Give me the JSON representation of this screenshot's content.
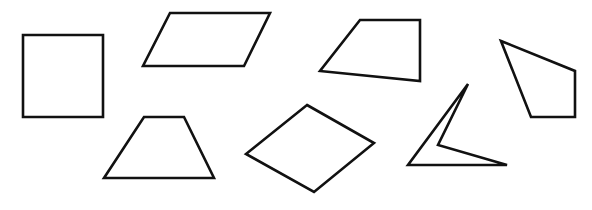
{
  "diagram": {
    "stroke_color": "#111111",
    "background": "#ffffff",
    "shapes": [
      {
        "id": "square",
        "kind": "square",
        "points": "23,35 103,35 103,117 23,117"
      },
      {
        "id": "parallelogram",
        "kind": "parallelogram",
        "points": "170,13 270,13 244,66 143,66"
      },
      {
        "id": "quad-right-angle",
        "kind": "quadrilateral",
        "points": "360,20 420,20 420,81 320,71"
      },
      {
        "id": "kite-like",
        "kind": "quadrilateral",
        "points": "501,41 575,71 575,117 531,117"
      },
      {
        "id": "trapezoid",
        "kind": "trapezoid",
        "points": "144,117 184,117 214,178 104,178"
      },
      {
        "id": "rhombus",
        "kind": "rhombus",
        "points": "307,105 374,143 314,192 246,154"
      },
      {
        "id": "concave-quad",
        "kind": "concave quadrilateral",
        "points": "468,84 438,145 507,165 408,165"
      }
    ]
  }
}
